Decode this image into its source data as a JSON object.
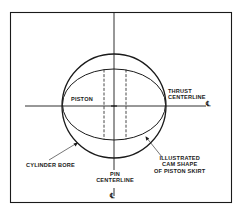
{
  "diagram": {
    "labels": {
      "piston": "PISTON",
      "thrust_line1": "THRUST",
      "thrust_line2": "CENTERLINE",
      "thrust_symbol": "℄",
      "cylinder_bore": "CYLINDER BORE",
      "cam_line1": "ILLUSTRATED",
      "cam_line2": "CAM SHAPE",
      "cam_line3": "OF PISTON SKIRT",
      "pin_line1": "PIN",
      "pin_line2": "CENTERLINE",
      "pin_symbol": "℄"
    },
    "colors": {
      "ink": "#1a1a1a",
      "background": "#ffffff"
    }
  }
}
